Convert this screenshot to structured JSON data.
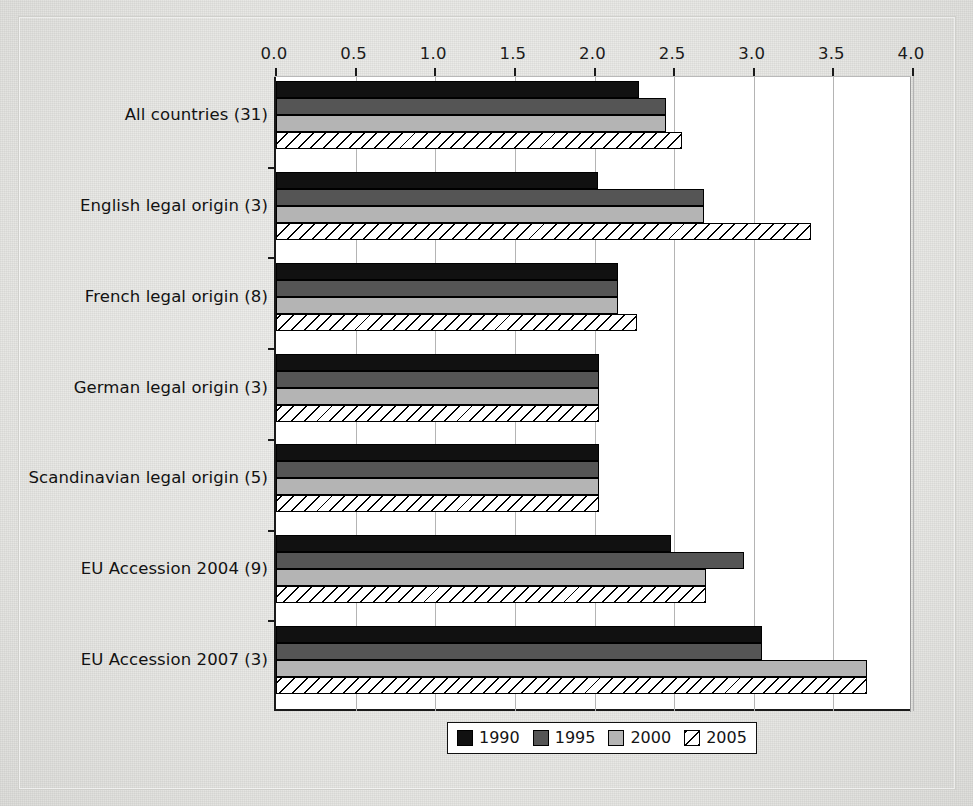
{
  "chart_data": {
    "type": "bar",
    "orientation": "horizontal",
    "title": "",
    "subtitle": "",
    "xlabel": "",
    "ylabel": "",
    "xlim": [
      0.0,
      4.0
    ],
    "xticks": [
      "0.0",
      "0.5",
      "1.0",
      "1.5",
      "2.0",
      "2.5",
      "3.0",
      "3.5",
      "4.0"
    ],
    "xtick_values": [
      0.0,
      0.5,
      1.0,
      1.5,
      2.0,
      2.5,
      3.0,
      3.5,
      4.0
    ],
    "grid": true,
    "grid_axis": "x",
    "legend_position": "bottom",
    "categories": [
      "All countries (31)",
      "English legal origin (3)",
      "French legal origin (8)",
      "German legal origin (3)",
      "Scandinavian legal origin (5)",
      "EU Accession 2004 (9)",
      "EU Accession 2007 (3)"
    ],
    "series": [
      {
        "name": "1990",
        "color": "#111111",
        "pattern": "solid",
        "values": [
          2.28,
          2.02,
          2.15,
          2.03,
          2.03,
          2.48,
          3.05
        ]
      },
      {
        "name": "1995",
        "color": "#555555",
        "pattern": "solid",
        "values": [
          2.45,
          2.69,
          2.15,
          2.03,
          2.03,
          2.94,
          3.05
        ]
      },
      {
        "name": "2000",
        "color": "#b4b4b4",
        "pattern": "solid",
        "values": [
          2.45,
          2.69,
          2.15,
          2.03,
          2.03,
          2.7,
          3.71
        ]
      },
      {
        "name": "2005",
        "color": "#ffffff",
        "pattern": "diagonal-hatch",
        "values": [
          2.55,
          3.36,
          2.27,
          2.03,
          2.03,
          2.7,
          3.71
        ]
      }
    ]
  },
  "legend": {
    "items": [
      {
        "label": "1990",
        "swatch": "legend-swatch-1990"
      },
      {
        "label": "1995",
        "swatch": "legend-swatch-1995"
      },
      {
        "label": "2000",
        "swatch": "legend-swatch-2000"
      },
      {
        "label": "2005",
        "swatch": "legend-swatch-2005"
      }
    ]
  }
}
